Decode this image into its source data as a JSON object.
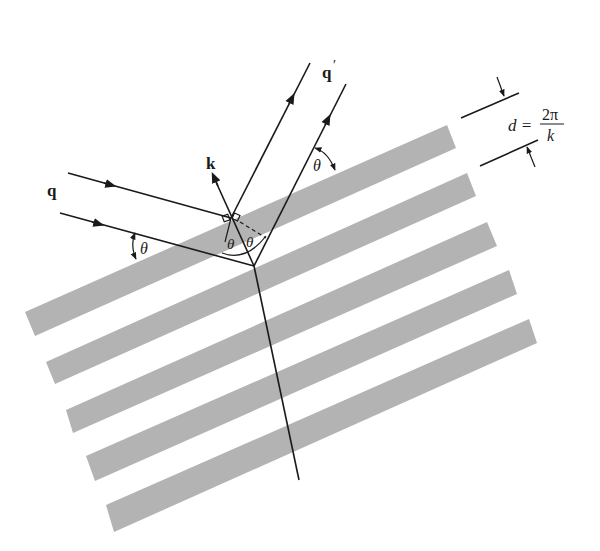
{
  "diagram": {
    "labels": {
      "incident": "q",
      "scattered": "q",
      "scattered_prime": "′",
      "wavevector": "k",
      "theta_left": "θ",
      "theta_right": "θ",
      "theta_inner_left": "θ",
      "theta_inner_right": "θ",
      "spacing_lhs": "d =",
      "spacing_num": "2π",
      "spacing_den": "k"
    },
    "colors": {
      "stripe": "#b3b3b3",
      "line": "#1a1a1a",
      "background": "#ffffff"
    },
    "stripes": [
      {
        "index": 1,
        "points": "25,312 447,125 456,148 35,336"
      },
      {
        "index": 2,
        "points": "46,362 467,173 476,196 55,384"
      },
      {
        "index": 3,
        "points": "66,410 487,222 497,246 73,433"
      },
      {
        "index": 4,
        "points": "86,456 509,270 517,294 95,481"
      },
      {
        "index": 5,
        "points": "106,505 529,319 537,343 114,532"
      }
    ],
    "stripe_count": 5
  }
}
